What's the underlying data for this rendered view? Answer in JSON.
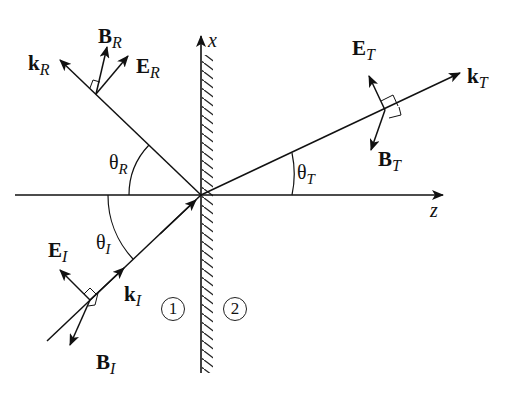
{
  "figure": {
    "axes": {
      "x_label": "x",
      "z_label": "z"
    },
    "vectors": {
      "incident": {
        "k": "k",
        "E": "E",
        "B": "B",
        "sub": "I"
      },
      "reflected": {
        "k": "k",
        "E": "E",
        "B": "B",
        "sub": "R"
      },
      "transmitted": {
        "k": "k",
        "E": "E",
        "B": "B",
        "sub": "T"
      }
    },
    "angles": {
      "incidence": {
        "symbol": "θ",
        "sub": "I"
      },
      "reflection": {
        "symbol": "θ",
        "sub": "R"
      },
      "transmission": {
        "symbol": "θ",
        "sub": "T"
      }
    },
    "regions": {
      "medium_1": "1",
      "medium_2": "2"
    },
    "colors": {
      "ink": "#111111",
      "background": "#ffffff"
    }
  }
}
